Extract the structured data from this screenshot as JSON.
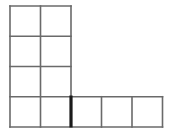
{
  "figure": {
    "type": "grid-diagram",
    "background_color": "#ffffff",
    "canvas": {
      "width": 171,
      "height": 135
    }
  },
  "style": {
    "line_color": "#6a6a6a",
    "line_width": 1.6,
    "highlight_color": "#1a1a1a",
    "highlight_width": 3.2,
    "cell_fill": "#ffffff"
  },
  "geometry": {
    "cell_width": 30.5,
    "cell_height": 30.25,
    "origin_x": 10,
    "origin_y": 6,
    "x_positions": [
      10,
      40.5,
      71,
      101.5,
      132,
      162.5
    ],
    "y_positions": [
      6,
      36.25,
      66.5,
      96.75,
      127
    ]
  },
  "shape": {
    "description": "Vertical 2-wide by 4-tall block with a 3-cell horizontal arm extending right from the bottom row",
    "total_cells": 11,
    "column_block": {
      "columns": 2,
      "rows": 4,
      "cells": 8
    },
    "arm_block": {
      "columns": 3,
      "rows": 1,
      "cells": 3
    }
  },
  "cells": [
    {
      "id": "cell-r0c0",
      "row": 0,
      "col": 0,
      "x": 10,
      "y": 6,
      "w": 30.5,
      "h": 30.25,
      "group": "column"
    },
    {
      "id": "cell-r0c1",
      "row": 0,
      "col": 1,
      "x": 40.5,
      "y": 6,
      "w": 30.5,
      "h": 30.25,
      "group": "column"
    },
    {
      "id": "cell-r1c0",
      "row": 1,
      "col": 0,
      "x": 10,
      "y": 36.25,
      "w": 30.5,
      "h": 30.25,
      "group": "column"
    },
    {
      "id": "cell-r1c1",
      "row": 1,
      "col": 1,
      "x": 40.5,
      "y": 36.25,
      "w": 30.5,
      "h": 30.25,
      "group": "column"
    },
    {
      "id": "cell-r2c0",
      "row": 2,
      "col": 0,
      "x": 10,
      "y": 66.5,
      "w": 30.5,
      "h": 30.25,
      "group": "column"
    },
    {
      "id": "cell-r2c1",
      "row": 2,
      "col": 1,
      "x": 40.5,
      "y": 66.5,
      "w": 30.5,
      "h": 30.25,
      "group": "column"
    },
    {
      "id": "cell-r3c0",
      "row": 3,
      "col": 0,
      "x": 10,
      "y": 96.75,
      "w": 30.5,
      "h": 30.25,
      "group": "column"
    },
    {
      "id": "cell-r3c1",
      "row": 3,
      "col": 1,
      "x": 40.5,
      "y": 96.75,
      "w": 30.5,
      "h": 30.25,
      "group": "column"
    },
    {
      "id": "cell-r3c2",
      "row": 3,
      "col": 2,
      "x": 71,
      "y": 96.75,
      "w": 30.5,
      "h": 30.25,
      "group": "arm"
    },
    {
      "id": "cell-r3c3",
      "row": 3,
      "col": 3,
      "x": 101.5,
      "y": 96.75,
      "w": 31,
      "h": 30.25,
      "group": "arm"
    },
    {
      "id": "cell-r3c4",
      "row": 3,
      "col": 4,
      "x": 132,
      "y": 96.75,
      "w": 30.5,
      "h": 30.25,
      "group": "arm"
    }
  ],
  "lines": [
    {
      "id": "h-top-column",
      "orientation": "horizontal",
      "x1": 10,
      "y1": 6,
      "x2": 71,
      "y2": 6
    },
    {
      "id": "h-row1-column",
      "orientation": "horizontal",
      "x1": 10,
      "y1": 36.25,
      "x2": 71,
      "y2": 36.25
    },
    {
      "id": "h-row2-column",
      "orientation": "horizontal",
      "x1": 10,
      "y1": 66.5,
      "x2": 71,
      "y2": 66.5
    },
    {
      "id": "h-row3-full",
      "orientation": "horizontal",
      "x1": 10,
      "y1": 96.75,
      "x2": 162.5,
      "y2": 96.75
    },
    {
      "id": "h-bottom-full",
      "orientation": "horizontal",
      "x1": 10,
      "y1": 127,
      "x2": 162.5,
      "y2": 127
    },
    {
      "id": "v-left-outer",
      "orientation": "vertical",
      "x1": 10,
      "y1": 6,
      "x2": 10,
      "y2": 127
    },
    {
      "id": "v-column-middle",
      "orientation": "vertical",
      "x1": 40.5,
      "y1": 6,
      "x2": 40.5,
      "y2": 127
    },
    {
      "id": "v-column-right",
      "orientation": "vertical",
      "x1": 71,
      "y1": 6,
      "x2": 71,
      "y2": 96.75
    },
    {
      "id": "v-arm-divider-1",
      "orientation": "vertical",
      "x1": 101.5,
      "y1": 96.75,
      "x2": 101.5,
      "y2": 127
    },
    {
      "id": "v-arm-divider-2",
      "orientation": "vertical",
      "x1": 132,
      "y1": 96.75,
      "x2": 132,
      "y2": 127
    },
    {
      "id": "v-arm-right-end",
      "orientation": "vertical",
      "x1": 162.5,
      "y1": 96.75,
      "x2": 162.5,
      "y2": 127
    }
  ],
  "highlight": {
    "id": "highlight-corner-edge",
    "description": "Thick dark vertical segment marking the inner corner edge between the column bottom cell and the arm",
    "x1": 71,
    "y1": 95.5,
    "x2": 71,
    "y2": 127.5
  }
}
